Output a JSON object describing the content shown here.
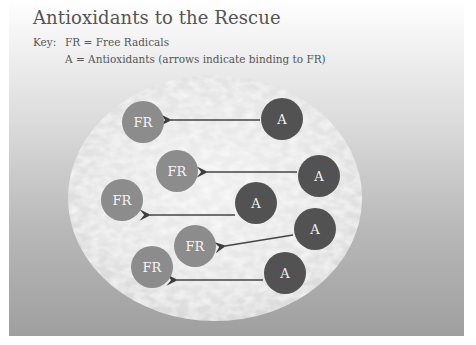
{
  "slide": {
    "title": "Antioxidants to the Rescue",
    "key": {
      "label": "Key:",
      "line1": "FR = Free Radicals",
      "line2": "A = Antioxidants (arrows indicate binding to FR)"
    }
  },
  "colors": {
    "free_radical": "#8c8c8c",
    "antioxidant": "#525252",
    "arrow": "#444444",
    "ellipse": "#e8e8e8"
  },
  "diagram": {
    "free_radicals": [
      {
        "label": "FR",
        "cx": 143,
        "cy": 122
      },
      {
        "label": "FR",
        "cx": 177,
        "cy": 171
      },
      {
        "label": "FR",
        "cx": 122,
        "cy": 200
      },
      {
        "label": "FR",
        "cx": 195,
        "cy": 246
      },
      {
        "label": "FR",
        "cx": 152,
        "cy": 267
      }
    ],
    "antioxidants": [
      {
        "label": "A",
        "cx": 282,
        "cy": 119
      },
      {
        "label": "A",
        "cx": 319,
        "cy": 176
      },
      {
        "label": "A",
        "cx": 256,
        "cy": 203
      },
      {
        "label": "A",
        "cx": 315,
        "cy": 229
      },
      {
        "label": "A",
        "cx": 285,
        "cy": 273
      }
    ],
    "arrows": [
      {
        "from": "A1",
        "to": "FR1"
      },
      {
        "from": "A2",
        "to": "FR2"
      },
      {
        "from": "A3",
        "to": "FR3"
      },
      {
        "from": "A4",
        "to": "FR4"
      },
      {
        "from": "A5",
        "to": "FR5"
      }
    ]
  }
}
